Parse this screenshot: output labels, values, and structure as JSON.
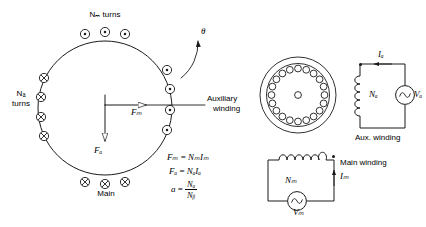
{
  "figure": {
    "stroke_color": "#1a1a1a",
    "background": "#ffffff"
  },
  "stator_diagram": {
    "top_label": "Nₘ turns",
    "top_label_plain": "Nm turns",
    "left_label_line1": "Nₐ",
    "left_label_line2": "turns",
    "left_label_plain": "Na turns",
    "bottom_label": "Main",
    "right_label_line1": "Auxiliary",
    "right_label_line2": "winding",
    "angle_label": "θ",
    "force_main_label": "Fₘ",
    "force_main_plain": "Fm",
    "force_aux_label": "Fₐ",
    "force_aux_plain": "Fa",
    "top_conductors": {
      "count": 3,
      "symbol": "dot",
      "meaning": "current-out-of-page"
    },
    "bottom_conductors": {
      "count": 3,
      "symbol": "cross",
      "meaning": "current-into-page"
    },
    "left_conductors": {
      "count": 4,
      "symbol": "cross",
      "meaning": "current-into-page"
    },
    "right_conductors": {
      "count": 4,
      "symbol": "dot",
      "meaning": "current-out-of-page"
    }
  },
  "equations": {
    "eq1_lhs": "Fₘ",
    "eq1_rhs": "NₘIₘ",
    "eq1_plain": "Fm = Nm Im",
    "eq2_lhs": "Fₐ",
    "eq2_rhs": "NₐIₐ",
    "eq2_plain": "Fa = Na Ia",
    "eq3_lhs": "a",
    "eq3_num": "Nₐ",
    "eq3_den": "Nᵦ",
    "eq3_plain": "a = Na / Nb",
    "equals": "="
  },
  "stator_cross_section": {
    "slot_count": 20,
    "has_rotor_circle": true,
    "has_shaft_dot": true
  },
  "aux_circuit": {
    "caption": "Aux. winding",
    "current_label": "Iₐ",
    "current_plain": "Ia",
    "coil_label": "Nₐ",
    "coil_plain": "Na",
    "source_label": "Vₐ",
    "source_plain": "Va",
    "source_type": "ac-sine",
    "polarity_dot": true,
    "current_direction": "leftward-at-top"
  },
  "main_circuit": {
    "caption": "Main winding",
    "current_label": "Iₘ",
    "current_plain": "Im",
    "coil_label": "Nₘ",
    "coil_plain": "Nm",
    "source_label": "Vₘ",
    "source_plain": "Vm",
    "source_type": "ac-sine",
    "polarity_dot": true,
    "current_direction": "upward-on-right-branch"
  }
}
